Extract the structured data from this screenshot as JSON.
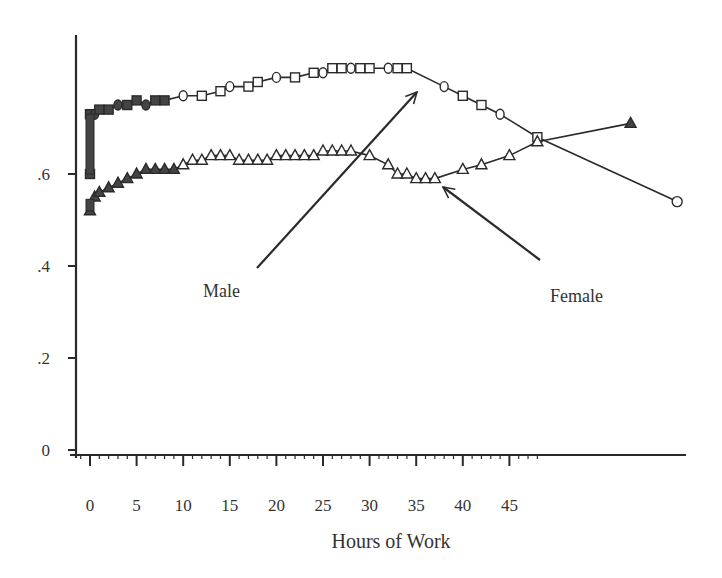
{
  "chart_data": {
    "type": "line",
    "title": "",
    "xlabel": "Hours of Work",
    "ylabel": "",
    "xlim": [
      -1,
      64
    ],
    "ylim": [
      0,
      0.87
    ],
    "grid": false,
    "x_ticks": [
      0,
      5,
      10,
      15,
      20,
      25,
      30,
      35,
      40,
      45
    ],
    "x_tick_labels": [
      "0",
      "5",
      "10",
      "15",
      "20",
      "25",
      "30",
      "35",
      "40",
      "45"
    ],
    "y_ticks": [
      0,
      0.2,
      0.4,
      0.6
    ],
    "y_tick_labels": [
      "0",
      ".2",
      ".4",
      ".6"
    ],
    "legend": null,
    "annotations": [
      {
        "text": "Male",
        "target_series": "Male",
        "label_pos": [
          203,
          297
        ],
        "arrow_from": [
          257,
          268
        ],
        "arrow_to": [
          417,
          92
        ]
      },
      {
        "text": "Female",
        "target_series": "Female",
        "label_pos": [
          550,
          300
        ],
        "arrow_from": [
          540,
          260
        ],
        "arrow_to": [
          443,
          187
        ]
      }
    ],
    "series": [
      {
        "name": "Male",
        "marker": "square/circle (hollow)",
        "x": [
          0,
          0,
          0.5,
          1,
          2,
          3,
          4,
          5,
          6,
          7,
          8,
          10,
          12,
          14,
          15,
          17,
          18,
          20,
          22,
          24,
          25,
          26,
          27,
          28,
          29,
          30,
          32,
          33,
          34,
          38,
          40,
          42,
          44,
          48,
          63
        ],
        "values": [
          0.6,
          0.73,
          0.73,
          0.74,
          0.74,
          0.75,
          0.75,
          0.76,
          0.75,
          0.76,
          0.76,
          0.77,
          0.77,
          0.78,
          0.79,
          0.79,
          0.8,
          0.81,
          0.81,
          0.82,
          0.82,
          0.83,
          0.83,
          0.83,
          0.83,
          0.83,
          0.83,
          0.83,
          0.83,
          0.79,
          0.77,
          0.75,
          0.73,
          0.68,
          0.54
        ]
      },
      {
        "name": "Female",
        "marker": "triangle (hollow)",
        "x": [
          0,
          0.5,
          1,
          2,
          3,
          4,
          5,
          6,
          7,
          8,
          9,
          10,
          11,
          12,
          13,
          14,
          15,
          16,
          17,
          18,
          19,
          20,
          21,
          22,
          23,
          24,
          25,
          26,
          27,
          28,
          30,
          32,
          33,
          34,
          35,
          36,
          37,
          40,
          42,
          45,
          48,
          58
        ],
        "values": [
          0.52,
          0.55,
          0.56,
          0.57,
          0.58,
          0.59,
          0.6,
          0.61,
          0.61,
          0.61,
          0.61,
          0.62,
          0.63,
          0.63,
          0.64,
          0.64,
          0.64,
          0.63,
          0.63,
          0.63,
          0.63,
          0.64,
          0.64,
          0.64,
          0.64,
          0.64,
          0.65,
          0.65,
          0.65,
          0.65,
          0.64,
          0.62,
          0.6,
          0.6,
          0.59,
          0.59,
          0.59,
          0.61,
          0.62,
          0.64,
          0.67,
          0.71
        ]
      }
    ]
  },
  "axes": {
    "x_title": "Hours of Work",
    "x_tick_labels": [
      "0",
      "5",
      "10",
      "15",
      "20",
      "25",
      "30",
      "35",
      "40",
      "45"
    ],
    "y_tick_labels": [
      "0",
      ".2",
      ".4",
      ".6"
    ]
  },
  "labels": {
    "male": "Male",
    "female": "Female"
  },
  "colors": {
    "ink": "#2a2a2a",
    "background": "#ffffff"
  }
}
